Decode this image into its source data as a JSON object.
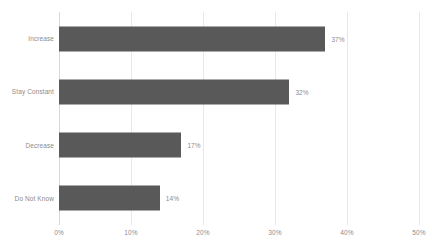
{
  "chart_data": {
    "type": "bar",
    "orientation": "horizontal",
    "title": "",
    "subtitle": "",
    "xlabel": "",
    "ylabel": "",
    "categories": [
      "Increase",
      "Stay Constant",
      "Decrease",
      "Do Not Know"
    ],
    "values": [
      37,
      32,
      17,
      14
    ],
    "value_labels": [
      "37%",
      "32%",
      "17%",
      "14%"
    ],
    "xlim": [
      0,
      50
    ],
    "xticks": [
      0,
      10,
      20,
      30,
      40,
      50
    ],
    "xtick_labels": [
      "0%",
      "10%",
      "20%",
      "30%",
      "40%",
      "50%"
    ],
    "grid": true,
    "grid_axis": "x",
    "legend": false,
    "legend_position": "none",
    "series": [
      {
        "name": "",
        "values": [
          37,
          32,
          17,
          14
        ]
      }
    ]
  },
  "style": {
    "bar_color": "#595959",
    "gridline_color": "#e8e8e8",
    "axis_color": "#d8d8d8",
    "label_color": "#8c8c8c",
    "background_color": "#ffffff"
  }
}
